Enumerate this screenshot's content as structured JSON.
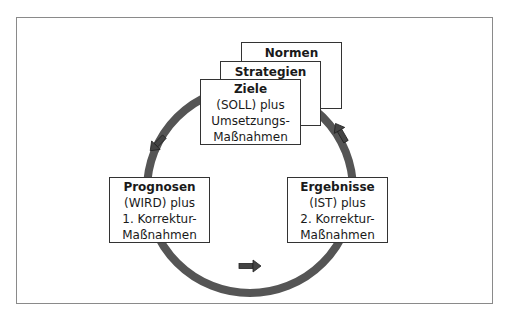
{
  "diagram": {
    "stack": {
      "normen": {
        "title": "Normen"
      },
      "strategien": {
        "title": "Strategien"
      },
      "ziele": {
        "title": "Ziele",
        "lines": [
          "(SOLL) plus",
          "Umsetzungs-",
          "Maßnahmen"
        ]
      }
    },
    "prognosen": {
      "title": "Prognosen",
      "lines": [
        "(WIRD) plus",
        "1. Korrektur-",
        "Maßnahmen"
      ]
    },
    "ergebnisse": {
      "title": "Ergebnisse",
      "lines": [
        "(IST) plus",
        "2. Korrektur-",
        "Maßnahmen"
      ]
    },
    "colors": {
      "ring": "#555555",
      "border": "#333333",
      "frame": "#8a8a8a"
    },
    "arrows": [
      "down-left-arrow",
      "right-arrow",
      "up-left-arrow"
    ]
  }
}
